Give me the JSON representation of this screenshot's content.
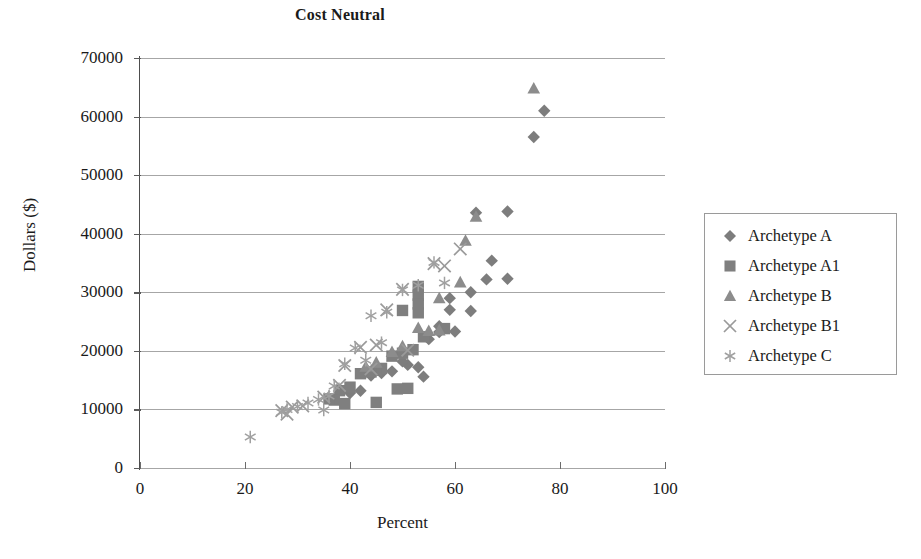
{
  "chart_data": {
    "type": "scatter",
    "title": "Cost Neutral",
    "xlabel": "Percent",
    "ylabel": "Dollars ($)",
    "xlim": [
      0,
      100
    ],
    "ylim": [
      0,
      70000
    ],
    "xticks": [
      0,
      20,
      40,
      60,
      80,
      100
    ],
    "yticks": [
      0,
      10000,
      20000,
      30000,
      40000,
      50000,
      60000,
      70000
    ],
    "grid": "horizontal",
    "legend_position": "right",
    "marker_color": "#8a8a8a",
    "series": [
      {
        "name": "Archetype A",
        "marker": "diamond",
        "color": "#7d7d7d",
        "points": [
          [
            77,
            61000
          ],
          [
            75,
            56500
          ],
          [
            70,
            43800
          ],
          [
            64,
            43600
          ],
          [
            67,
            35400
          ],
          [
            70,
            32300
          ],
          [
            66,
            32200
          ],
          [
            63,
            30000
          ],
          [
            59,
            29000
          ],
          [
            63,
            26800
          ],
          [
            59,
            27000
          ],
          [
            60,
            23300
          ],
          [
            57,
            23200
          ],
          [
            55,
            22000
          ],
          [
            54,
            15600
          ],
          [
            53,
            17200
          ],
          [
            51,
            17600
          ],
          [
            50,
            18200
          ],
          [
            48,
            16500
          ],
          [
            46,
            16200
          ],
          [
            44,
            15800
          ],
          [
            42,
            13200
          ],
          [
            40,
            12800
          ],
          [
            57,
            24200
          ]
        ]
      },
      {
        "name": "Archetype A1",
        "marker": "square",
        "color": "#7f7f7f",
        "points": [
          [
            53,
            31000
          ],
          [
            53,
            29500
          ],
          [
            53,
            28000
          ],
          [
            53,
            26500
          ],
          [
            50,
            26900
          ],
          [
            58,
            23800
          ],
          [
            54,
            22400
          ],
          [
            52,
            20200
          ],
          [
            50,
            19600
          ],
          [
            48,
            19100
          ],
          [
            46,
            17000
          ],
          [
            45,
            16700
          ],
          [
            44,
            16400
          ],
          [
            42,
            16100
          ],
          [
            40,
            13800
          ],
          [
            38,
            13200
          ],
          [
            45,
            11200
          ],
          [
            37,
            11600
          ],
          [
            36,
            11800
          ],
          [
            39,
            11000
          ],
          [
            49,
            13500
          ],
          [
            51,
            13600
          ]
        ]
      },
      {
        "name": "Archetype B",
        "marker": "triangle",
        "color": "#8c8c8c",
        "points": [
          [
            75,
            64800
          ],
          [
            64,
            42900
          ],
          [
            62,
            38800
          ],
          [
            61,
            31700
          ],
          [
            57,
            29000
          ],
          [
            57,
            23500
          ],
          [
            55,
            23400
          ],
          [
            53,
            23900
          ],
          [
            50,
            20800
          ],
          [
            48,
            19800
          ],
          [
            45,
            18000
          ],
          [
            43,
            17300
          ]
        ]
      },
      {
        "name": "Archetype B1",
        "marker": "x",
        "color": "#9a9a9a",
        "points": [
          [
            61,
            37400
          ],
          [
            58,
            34500
          ],
          [
            56,
            34900
          ],
          [
            50,
            30500
          ],
          [
            47,
            27000
          ],
          [
            45,
            21000
          ],
          [
            42,
            20600
          ],
          [
            39,
            17500
          ],
          [
            38,
            14100
          ],
          [
            35,
            12100
          ],
          [
            31,
            10600
          ],
          [
            29,
            10400
          ],
          [
            28,
            9200
          ],
          [
            27,
            9800
          ],
          [
            44,
            16900
          ],
          [
            51,
            20100
          ]
        ]
      },
      {
        "name": "Archetype C",
        "marker": "asterisk",
        "color": "#a0a0a0",
        "points": [
          [
            58,
            31600
          ],
          [
            56,
            35100
          ],
          [
            53,
            31200
          ],
          [
            50,
            30400
          ],
          [
            47,
            26600
          ],
          [
            44,
            26000
          ],
          [
            41,
            20500
          ],
          [
            39,
            17800
          ],
          [
            37,
            14000
          ],
          [
            36,
            12300
          ],
          [
            34,
            11700
          ],
          [
            32,
            11100
          ],
          [
            30,
            10500
          ],
          [
            28,
            10000
          ],
          [
            27,
            9500
          ],
          [
            21,
            5300
          ],
          [
            46,
            21400
          ],
          [
            43,
            18400
          ],
          [
            35,
            9900
          ]
        ]
      }
    ]
  },
  "legend": {
    "items": [
      {
        "label": "Archetype A",
        "marker": "diamond-icon"
      },
      {
        "label": "Archetype A1",
        "marker": "square-icon"
      },
      {
        "label": "Archetype B",
        "marker": "triangle-icon"
      },
      {
        "label": "Archetype B1",
        "marker": "x-icon"
      },
      {
        "label": "Archetype C",
        "marker": "asterisk-icon"
      }
    ]
  }
}
